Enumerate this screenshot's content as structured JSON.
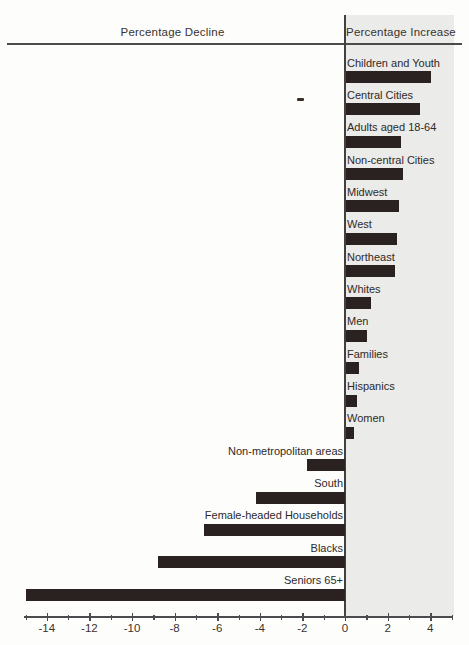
{
  "header": {
    "left_label": "Percentage Decline",
    "right_label": "Percentage Increase"
  },
  "chart_data": {
    "type": "bar",
    "orientation": "horizontal",
    "title": "",
    "xlabel": "",
    "ylabel": "",
    "categories": [
      "Children and Youth",
      "Central Cities",
      "Adults aged 18-64",
      "Non-central Cities",
      "Midwest",
      "West",
      "Northeast",
      "Whites",
      "Men",
      "Families",
      "Hispanics",
      "Women",
      "Non-metropolitan areas",
      "South",
      "Female-headed Households",
      "Blacks",
      "Seniors 65+"
    ],
    "values": [
      4.0,
      3.5,
      2.6,
      2.7,
      2.5,
      2.4,
      2.3,
      1.2,
      1.0,
      0.6,
      0.5,
      0.4,
      -1.8,
      -4.2,
      -6.6,
      -8.8,
      -15.0
    ],
    "xlim": [
      -15,
      5
    ],
    "x_major_ticks": [
      -14,
      -12,
      -10,
      -8,
      -6,
      -4,
      -2,
      0,
      2,
      4
    ],
    "x_major_tick_labels": [
      "-14",
      "-12",
      "-10",
      "-8",
      "-6",
      "-4",
      "-2",
      "0",
      "2",
      "4"
    ],
    "x_minor_tick_step": 1,
    "grid": false,
    "legend": false,
    "zero_line": true,
    "colors": {
      "bar": "#292220",
      "increase_panel": "#ebebe9",
      "axis": "#4b4a4c",
      "text": "#2e2a28"
    }
  }
}
